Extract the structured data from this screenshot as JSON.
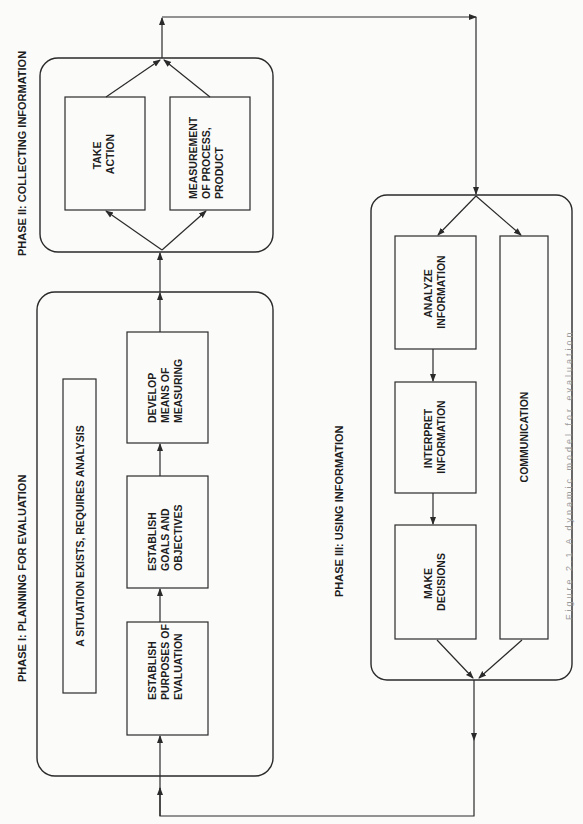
{
  "phases": {
    "phase1": {
      "title": "PHASE I: PLANNING FOR EVALUATION",
      "situation": "A SITUATION EXISTS, REQUIRES ANALYSIS",
      "steps": [
        {
          "lines": [
            "ESTABLISH",
            "PURPOSES OF",
            "EVALUATION"
          ]
        },
        {
          "lines": [
            "ESTABLISH",
            "GOALS AND",
            "OBJECTIVES"
          ]
        },
        {
          "lines": [
            "DEVELOP",
            "MEANS OF",
            "MEASURING"
          ]
        }
      ]
    },
    "phase2": {
      "title": "PHASE II: COLLECTING INFORMATION",
      "steps": [
        {
          "lines": [
            "TAKE",
            "ACTION"
          ]
        },
        {
          "lines": [
            "MEASUREMENT",
            "OF PROCESS,",
            "PRODUCT"
          ]
        }
      ]
    },
    "phase3": {
      "title": "PHASE III: USING INFORMATION",
      "steps": [
        {
          "lines": [
            "ANALYZE",
            "INFORMATION"
          ]
        },
        {
          "lines": [
            "INTERPRET",
            "INFORMATION"
          ]
        },
        {
          "lines": [
            "MAKE",
            "DECISIONS"
          ]
        }
      ],
      "communication": "COMMUNICATION"
    }
  },
  "caption": "Figure 2.1 A dynamic model for evaluation",
  "colors": {
    "line": "#2a2a2a",
    "text": "#1e1e1e",
    "background": "#fbfbfa"
  }
}
